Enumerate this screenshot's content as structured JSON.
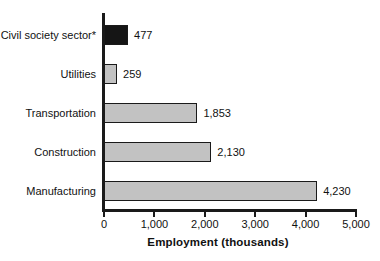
{
  "chart_data": {
    "type": "bar",
    "orientation": "horizontal",
    "title": "",
    "xlabel": "Employment (thousands)",
    "ylabel": "",
    "xlim": [
      0,
      5000
    ],
    "grid": false,
    "legend": null,
    "categories": [
      "Civil society sector*",
      "Utilities",
      "Transportation",
      "Construction",
      "Manufacturing"
    ],
    "values": [
      477,
      259,
      1853,
      2130,
      4230
    ],
    "value_labels": [
      "477",
      "259",
      "1,853",
      "2,130",
      "4,230"
    ],
    "bar_colors": [
      "#151515",
      "#c2c2c2",
      "#c2c2c2",
      "#c2c2c2",
      "#c2c2c2"
    ],
    "xticks": [
      0,
      1000,
      2000,
      3000,
      4000,
      5000
    ],
    "xtick_labels": [
      "0",
      "1,000",
      "2,000",
      "3,000",
      "4,000",
      "5,000"
    ]
  },
  "style": {
    "axis_color": "#1a1a1a",
    "bar_border_color": "#1a1a1a",
    "bar_fill_gray": "#c2c2c2",
    "bar_fill_highlight": "#151515",
    "background": "#ffffff",
    "text_color": "#111111"
  }
}
